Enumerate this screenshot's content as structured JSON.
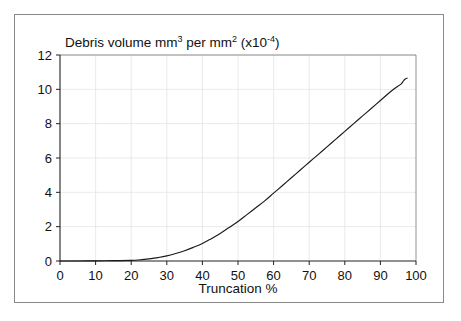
{
  "figure": {
    "name": "debris-volume-vs-truncation",
    "background_color": "#ffffff",
    "frame_color": "#8a8a8a",
    "axis_color": "#333333",
    "grid_color": "#e4e4e4",
    "curve_color": "#1a1a1a"
  },
  "title": {
    "prefix": "Debris volume mm",
    "sup1": "3",
    "mid": " per mm",
    "sup2": "2",
    "suffix_open": " (x10",
    "sup3": "-4",
    "suffix_close": ")",
    "full": "Debris volume mm3 per mm2 (x10-4)"
  },
  "x_axis": {
    "label": "Truncation %",
    "ticks": [
      "0",
      "10",
      "20",
      "30",
      "40",
      "50",
      "60",
      "70",
      "80",
      "90",
      "100"
    ]
  },
  "y_axis": {
    "label": "",
    "ticks": [
      "0",
      "2",
      "4",
      "6",
      "8",
      "10",
      "12"
    ]
  },
  "chart_data": {
    "type": "line",
    "title": "Debris volume mm3 per mm2 (x10-4)",
    "xlabel": "Truncation %",
    "ylabel": "Debris volume mm3 per mm2 (x10-4)",
    "xlim": [
      0,
      100
    ],
    "ylim": [
      0,
      12
    ],
    "xticks": [
      0,
      10,
      20,
      30,
      40,
      50,
      60,
      70,
      80,
      90,
      100
    ],
    "yticks": [
      0,
      2,
      4,
      6,
      8,
      10,
      12
    ],
    "grid": true,
    "legend": false,
    "legend_position": "none",
    "series": [
      {
        "name": "Debris volume",
        "x": [
          0,
          5,
          10,
          15,
          20,
          22,
          25,
          27.5,
          30,
          32.5,
          35,
          37.5,
          40,
          42.5,
          45,
          47.5,
          50,
          52.5,
          55,
          57.5,
          60,
          62.5,
          65,
          67.5,
          70,
          72.5,
          75,
          77.5,
          80,
          82.5,
          85,
          87.5,
          90,
          92.5,
          94,
          95,
          95.8,
          96.5,
          97,
          97.5
        ],
        "y": [
          0.0,
          0.0,
          0.01,
          0.02,
          0.04,
          0.06,
          0.12,
          0.2,
          0.3,
          0.44,
          0.6,
          0.8,
          1.02,
          1.3,
          1.6,
          1.95,
          2.3,
          2.7,
          3.1,
          3.5,
          3.95,
          4.4,
          4.85,
          5.3,
          5.75,
          6.2,
          6.65,
          7.1,
          7.55,
          8.0,
          8.45,
          8.9,
          9.35,
          9.8,
          10.05,
          10.2,
          10.3,
          10.5,
          10.6,
          10.65
        ]
      }
    ],
    "annotations": [
      {
        "text": "curve flattens slightly near x=96 before ending at about y=10.6"
      }
    ]
  }
}
